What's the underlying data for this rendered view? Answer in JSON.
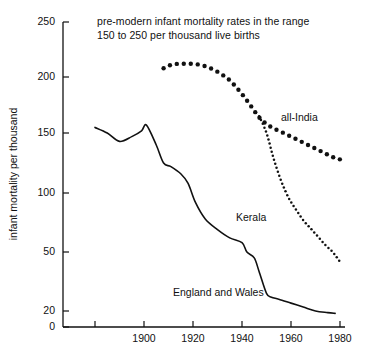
{
  "chart_data": {
    "type": "line",
    "title": "pre-modern infant mortality rates in the range 150 to 250 per thousand live births",
    "title_lines": [
      "pre-modern infant mortality rates in the range",
      "150 to 250 per thousand live births"
    ],
    "xlabel": "",
    "ylabel": "infant mortality per thousand",
    "xlim": [
      1875,
      1980
    ],
    "ylim": [
      0,
      250
    ],
    "xticks": [
      1880,
      1900,
      1920,
      1940,
      1960,
      1980
    ],
    "xtick_labels": [
      "",
      "1900",
      "1920",
      "1940",
      "1960",
      "1980"
    ],
    "yticks": [
      0,
      20,
      50,
      100,
      150,
      200,
      250
    ],
    "ytick_labels": [
      "0",
      "20",
      "50",
      "100",
      "150",
      "200",
      "250"
    ],
    "grid": false,
    "legend_position": "inline-annotations",
    "series": [
      {
        "name": "England and Wales",
        "style": "solid-line",
        "label_text": "England and Wales",
        "x": [
          1880,
          1885,
          1890,
          1895,
          1899,
          1901,
          1905,
          1908,
          1911,
          1915,
          1918,
          1921,
          1925,
          1930,
          1935,
          1940,
          1942,
          1945,
          1947,
          1950,
          1952,
          1955,
          1960,
          1965,
          1970,
          1975,
          1978
        ],
        "y": [
          155,
          150,
          143,
          147,
          152,
          157,
          140,
          125,
          122,
          116,
          108,
          92,
          78,
          69,
          62,
          58,
          50,
          47,
          40,
          29,
          27,
          26,
          24,
          22,
          20,
          18,
          17
        ]
      },
      {
        "name": "all-India",
        "style": "large-dotted",
        "label_text": "all-India",
        "x": [
          1908,
          1911,
          1914,
          1917,
          1920,
          1923,
          1926,
          1929,
          1932,
          1935,
          1938,
          1941,
          1944,
          1947,
          1950,
          1953,
          1956,
          1959,
          1962,
          1965,
          1968,
          1971,
          1974,
          1977,
          1980
        ],
        "y": [
          208,
          211,
          212,
          212,
          212,
          211,
          209,
          206,
          202,
          197,
          190,
          182,
          173,
          164,
          158,
          154,
          151,
          148,
          145,
          142,
          139,
          136,
          133,
          130,
          128
        ]
      },
      {
        "name": "Kerala",
        "style": "fine-dotted",
        "label_text": "Kerala",
        "x": [
          1947,
          1950,
          1953,
          1956,
          1959,
          1962,
          1965,
          1968,
          1971,
          1974,
          1977,
          1980
        ],
        "y": [
          165,
          150,
          128,
          110,
          96,
          86,
          77,
          70,
          63,
          56,
          50,
          45
        ]
      }
    ],
    "annotations": [
      {
        "text": "all-India",
        "x": 1966,
        "y": 168
      },
      {
        "text": "Kerala",
        "x": 1947,
        "y": 92
      },
      {
        "text": "England and Wales",
        "x": 1921,
        "y": 33
      }
    ]
  },
  "colors": {
    "axis": "#111111",
    "line": "#111111",
    "text": "#111111",
    "background": "#ffffff"
  }
}
